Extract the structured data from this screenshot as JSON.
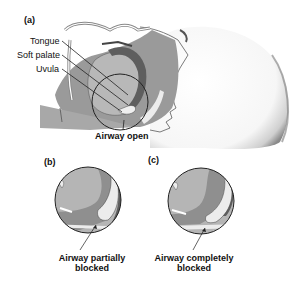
{
  "figure": {
    "panels": [
      {
        "id": "a",
        "label": "(a)",
        "labels": {
          "tongue": "Tongue",
          "soft_palate": "Soft palate",
          "uvula": "Uvula"
        },
        "caption": "Airway open"
      },
      {
        "id": "b",
        "label": "(b)",
        "caption_line1": "Airway partially",
        "caption_line2": "blocked"
      },
      {
        "id": "c",
        "label": "(c)",
        "caption_line1": "Airway completely",
        "caption_line2": "blocked"
      }
    ],
    "colors": {
      "tissue_light": "#b5b5b5",
      "tissue_mid": "#8f8f8f",
      "tissue_dark": "#5e5e5e",
      "airway": "#e8e8e8",
      "outline": "#222222",
      "skin_shadow": "#6a6a6a"
    }
  }
}
